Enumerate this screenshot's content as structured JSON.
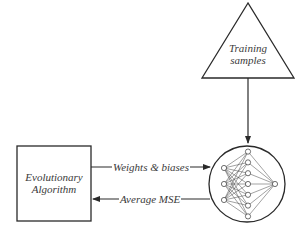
{
  "diagram": {
    "nodes": {
      "training": {
        "shape": "triangle",
        "line1": "Training",
        "line2": "samples"
      },
      "ea": {
        "shape": "rectangle",
        "line1": "Evolutionary",
        "line2": "Algorithm"
      },
      "network": {
        "shape": "circle",
        "content": "neural-network",
        "layers": [
          3,
          7,
          1
        ]
      }
    },
    "edges": [
      {
        "from": "training",
        "to": "network",
        "label": ""
      },
      {
        "from": "ea",
        "to": "network",
        "label": "Weights & biases"
      },
      {
        "from": "network",
        "to": "ea",
        "label": "Average MSE"
      }
    ],
    "colors": {
      "stroke": "#2a2a2a",
      "text": "#3a3a3a",
      "background": "#ffffff"
    }
  }
}
